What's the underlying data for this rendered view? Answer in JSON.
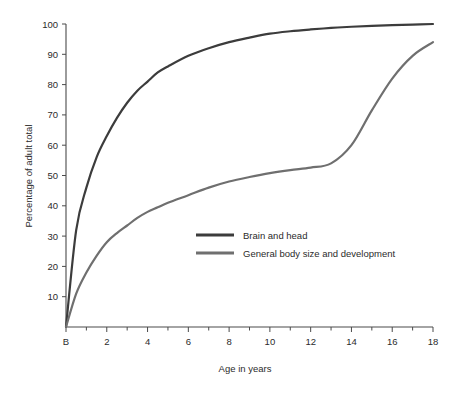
{
  "chart_data": {
    "type": "line",
    "title": "",
    "xlabel": "Age in years",
    "ylabel": "Percentage of adult total",
    "xlim": [
      0,
      18
    ],
    "ylim": [
      0,
      100
    ],
    "grid": false,
    "legend_position": "center",
    "x_tick_labels": [
      "B",
      "2",
      "4",
      "6",
      "8",
      "10",
      "12",
      "14",
      "16",
      "18"
    ],
    "x_tick_values": [
      0,
      2,
      4,
      6,
      8,
      10,
      12,
      14,
      16,
      18
    ],
    "x_minor_ticks": [
      1,
      3,
      5,
      7,
      9,
      11,
      13,
      15,
      17
    ],
    "y_tick_labels": [
      "10",
      "20",
      "30",
      "40",
      "50",
      "60",
      "70",
      "80",
      "90",
      "100"
    ],
    "y_tick_values": [
      10,
      20,
      30,
      40,
      50,
      60,
      70,
      80,
      90,
      100
    ],
    "x": [
      0,
      0.5,
      1,
      1.5,
      2,
      2.5,
      3,
      3.5,
      4,
      4.5,
      5,
      6,
      7,
      8,
      9,
      10,
      11,
      12,
      13,
      14,
      15,
      16,
      17,
      18
    ],
    "series": [
      {
        "name": "Brain and head",
        "color": "#3c3c3c",
        "values": [
          0,
          32,
          46,
          56,
          63,
          69,
          74,
          78,
          81,
          84,
          86,
          89.5,
          92,
          94,
          95.5,
          96.8,
          97.6,
          98.2,
          98.7,
          99.1,
          99.4,
          99.6,
          99.8,
          100
        ]
      },
      {
        "name": "General body size and development",
        "color": "#6f6f6f",
        "values": [
          0,
          11,
          18,
          23.5,
          28,
          31,
          33.5,
          36,
          38,
          39.5,
          41,
          43.5,
          46,
          48,
          49.5,
          50.8,
          51.8,
          52.6,
          54,
          60,
          71.5,
          82,
          89.5,
          94
        ]
      }
    ]
  },
  "legend": {
    "items": [
      {
        "label": "Brain and head",
        "color": "#3c3c3c"
      },
      {
        "label": "General body size and development",
        "color": "#6f6f6f"
      }
    ]
  }
}
